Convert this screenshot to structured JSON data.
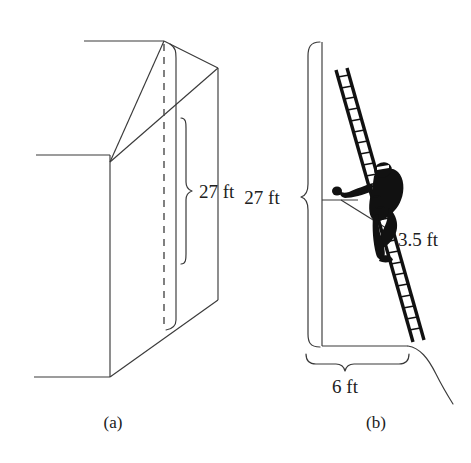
{
  "figure": {
    "panels": [
      {
        "id": "panel-a",
        "caption": "(a)",
        "dimensions": [
          {
            "id": "height-label-a",
            "label": "27 ft"
          }
        ]
      },
      {
        "id": "panel-b",
        "caption": "(b)",
        "dimensions": [
          {
            "id": "height-label-b",
            "label": "27 ft"
          },
          {
            "id": "ladder-offset-label",
            "label": "3.5 ft"
          },
          {
            "id": "base-label",
            "label": "6 ft"
          }
        ]
      }
    ],
    "labels": {
      "wall_height_a": "27 ft",
      "wall_height_b": "27 ft",
      "ladder_overhang": "3.5 ft",
      "base_distance": "6 ft",
      "caption_a": "(a)",
      "caption_b": "(b)"
    },
    "colors": {
      "background": "#ffffff",
      "line": "#3a3a3a",
      "ink": "#111111",
      "text": "#202020"
    },
    "icons": {
      "ladder": "ladder-icon",
      "climber": "person-climbing-icon"
    }
  }
}
